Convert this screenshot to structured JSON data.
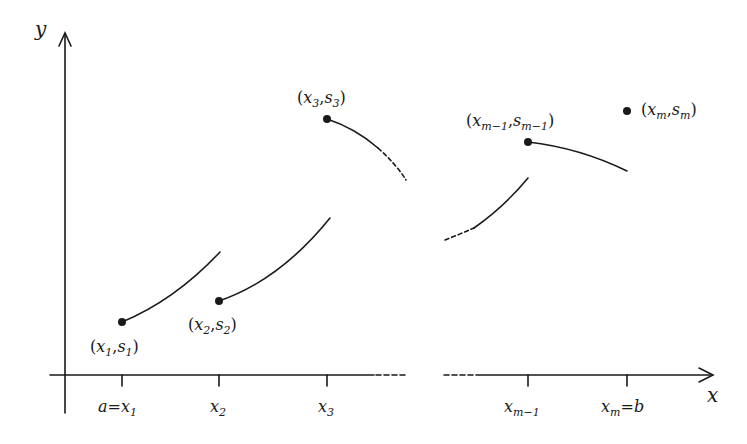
{
  "diagram": {
    "type": "piecewise-function-sketch",
    "colors": {
      "ink": "#1a1a1a",
      "background": "#ffffff"
    },
    "axes": {
      "x_label": "x",
      "y_label": "y"
    },
    "ticks": [
      {
        "id": "x1",
        "base": "a=x",
        "sub": "1",
        "px": 122
      },
      {
        "id": "x2",
        "base": "x",
        "sub": "2",
        "px": 219
      },
      {
        "id": "x3",
        "base": "x",
        "sub": "3",
        "px": 327
      },
      {
        "id": "xm1",
        "base": "x",
        "sub": "m−1",
        "px": 528
      },
      {
        "id": "xm",
        "base": "x",
        "sub": "m",
        "suffix": "=b",
        "px": 627
      }
    ],
    "points": [
      {
        "id": "p1",
        "label_open": "(",
        "x": "x",
        "xs": "1",
        "sep": ",",
        "s": "s",
        "ss": "1",
        "label_close": ")"
      },
      {
        "id": "p2",
        "label_open": "(",
        "x": "x",
        "xs": "2",
        "sep": ",",
        "s": "s",
        "ss": "2",
        "label_close": ")"
      },
      {
        "id": "p3",
        "label_open": "(",
        "x": "x",
        "xs": "3",
        "sep": ",",
        "s": "s",
        "ss": "3",
        "label_close": ")"
      },
      {
        "id": "pm1",
        "label_open": "(",
        "x": "x",
        "xs": "m−1",
        "sep": ",",
        "s": "s",
        "ss": "m−1",
        "label_close": ")"
      },
      {
        "id": "pm",
        "label_open": "(",
        "x": "x",
        "xs": "m",
        "sep": ",",
        "s": "s",
        "ss": "m",
        "label_close": ")"
      }
    ],
    "segments": [
      {
        "from": "(x1,s1)",
        "to": "x2",
        "style": "solid",
        "shape": "increasing, concave"
      },
      {
        "from": "(x2,s2)",
        "to": "x3",
        "style": "solid",
        "shape": "increasing, concave"
      },
      {
        "from": "(x3,s3)",
        "to": "x4",
        "style": "solid then dashed",
        "shape": "decreasing"
      },
      {
        "from": "x_{m-2}",
        "to": "x_{m-1}",
        "style": "dashed then solid",
        "shape": "increasing"
      },
      {
        "from": "(x_{m-1},s_{m-1})",
        "to": "x_m",
        "style": "solid",
        "shape": "decreasing"
      }
    ],
    "axis_break": "dashed gap in x-axis between x3 and x_{m-1}"
  }
}
